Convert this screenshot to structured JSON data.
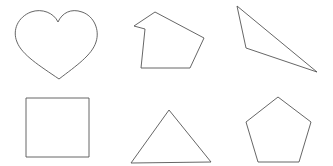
{
  "canvas": {
    "width": 333,
    "height": 166,
    "background_color": "#ffffff",
    "stroke_color": "#555555",
    "stroke_width": 0.9,
    "fill": "none",
    "layout": "2 rows x 3 columns of outlined geometric shapes"
  },
  "shapes": [
    {
      "id": "heart",
      "name": "heart",
      "row": 1,
      "column": 1,
      "kind": "curved",
      "vertices_note": "two lobe arcs meeting at a top notch and a bottom tip",
      "bounds": {
        "x": 14,
        "y": 11,
        "width": 81,
        "height": 68
      },
      "key_points": {
        "top_notch": [
          58,
          22
        ],
        "bottom_tip": [
          59,
          79
        ],
        "left_extreme": [
          14,
          33
        ],
        "right_extreme": [
          95,
          32
        ],
        "left_lobe_top": [
          33,
          12
        ],
        "right_lobe_top": [
          77,
          12
        ]
      },
      "path": "M 58 22 C 54 13 42 8 31 12 C 18 17 12 30 17 42 C 22 55 40 66 59 79 C 76 66 92 55 96 42 C 100 30 94 16 82 12 C 71 8 62 13 58 22 Z"
    },
    {
      "id": "concave-hexagon",
      "name": "irregular-concave-hexagon",
      "row": 1,
      "column": 2,
      "kind": "polygon",
      "sides": 6,
      "convex": false,
      "bounds": {
        "x": 134,
        "y": 11,
        "width": 70,
        "height": 58
      },
      "points": [
        [
          155,
          12
        ],
        [
          134,
          26
        ],
        [
          145,
          29
        ],
        [
          141,
          68
        ],
        [
          190,
          68
        ],
        [
          204,
          38
        ]
      ],
      "path": "M 155 12 L 134 26 L 145 29 L 141 68 L 190 68 L 204 38 Z"
    },
    {
      "id": "obtuse-triangle",
      "name": "obtuse-scalene-triangle",
      "row": 1,
      "column": 3,
      "kind": "polygon",
      "sides": 3,
      "convex": true,
      "bounds": {
        "x": 237,
        "y": 6,
        "width": 80,
        "height": 66
      },
      "points": [
        [
          237,
          6
        ],
        [
          246,
          48
        ],
        [
          317,
          72
        ]
      ],
      "path": "M 237 6 L 246 48 L 317 72 Z"
    },
    {
      "id": "square",
      "name": "square",
      "row": 2,
      "column": 1,
      "kind": "polygon",
      "sides": 4,
      "convex": true,
      "bounds": {
        "x": 26,
        "y": 98,
        "width": 63,
        "height": 59
      },
      "points": [
        [
          26,
          98
        ],
        [
          89,
          98
        ],
        [
          89,
          157
        ],
        [
          26,
          157
        ]
      ],
      "path": "M 26 98 L 89 98 L 89 157 L 26 157 Z"
    },
    {
      "id": "isosceles-triangle",
      "name": "isosceles-triangle",
      "row": 2,
      "column": 2,
      "kind": "polygon",
      "sides": 3,
      "convex": true,
      "bounds": {
        "x": 131,
        "y": 110,
        "width": 80,
        "height": 53
      },
      "points": [
        [
          169,
          110
        ],
        [
          211,
          162
        ],
        [
          131,
          163
        ]
      ],
      "path": "M 169 110 L 211 162 L 131 163 Z"
    },
    {
      "id": "pentagon",
      "name": "regular-pentagon",
      "row": 2,
      "column": 3,
      "kind": "polygon",
      "sides": 5,
      "convex": true,
      "bounds": {
        "x": 246,
        "y": 97,
        "width": 65,
        "height": 65
      },
      "points": [
        [
          278,
          97
        ],
        [
          311,
          122
        ],
        [
          299,
          162
        ],
        [
          258,
          162
        ],
        [
          246,
          122
        ]
      ],
      "path": "M 278 97 L 311 122 L 299 162 L 258 162 L 246 122 Z"
    }
  ]
}
